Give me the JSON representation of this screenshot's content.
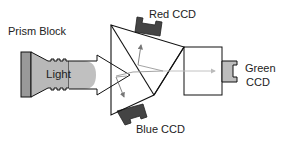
{
  "labels": {
    "prism_block": "Prism Block",
    "light": "Light",
    "red_ccd": "Red CCD",
    "green_ccd_line1": "Green",
    "green_ccd_line2": "CCD",
    "blue_ccd": "Blue CCD"
  },
  "colors": {
    "outline": "#111111",
    "light_fill": "#b8b8b8",
    "ccd_dark": "#444444",
    "ccd_green_fill": "#bdbdbd",
    "ray_gray": "#888888",
    "ray_light": "#c4c4c4",
    "background": "#ffffff"
  }
}
